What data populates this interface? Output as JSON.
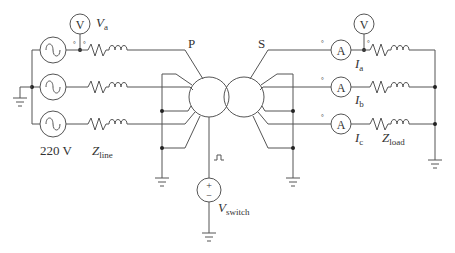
{
  "diagram": {
    "type": "three-phase transformer test circuit",
    "source": {
      "label": "220 V",
      "phases": 3
    },
    "voltmeter_primary": {
      "symbol": "V",
      "label": "V",
      "label_sub": "a"
    },
    "line_impedance": {
      "label": "Z",
      "label_sub": "line"
    },
    "transformer": {
      "primary_label": "P",
      "secondary_label": "S"
    },
    "switch_source": {
      "label": "V",
      "label_sub": "switch",
      "plus": "+",
      "minus": "−",
      "pulse_glyph": "⎍"
    },
    "ammeters": [
      {
        "symbol": "A",
        "label": "I",
        "label_sub": "a"
      },
      {
        "symbol": "A",
        "label": "I",
        "label_sub": "b"
      },
      {
        "symbol": "A",
        "label": "I",
        "label_sub": "c"
      }
    ],
    "voltmeter_secondary": {
      "symbol": "V"
    },
    "load_impedance": {
      "label": "Z",
      "label_sub": "load"
    },
    "source_symbol": "~",
    "polarity_mark": "°"
  }
}
